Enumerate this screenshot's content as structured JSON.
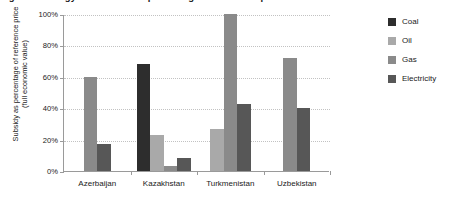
{
  "figure": {
    "title": "Figure 3. Energy subsidies as a percentage of reference price"
  },
  "axes": {
    "ylabel_line1": "Subsidy as percentage of reference price",
    "ylabel_line2": "(full economic value)",
    "ytick_labels": [
      "0%",
      "20%",
      "40%",
      "60%",
      "80%",
      "100%"
    ]
  },
  "legend": {
    "items": [
      {
        "label": "Coal",
        "color": "#2d2d2d"
      },
      {
        "label": "Oil",
        "color": "#a9a9a9"
      },
      {
        "label": "Gas",
        "color": "#8a8a8a"
      },
      {
        "label": "Electricity",
        "color": "#575757"
      }
    ]
  },
  "chart_data": {
    "type": "bar",
    "title": "Figure 3. Energy subsidies as a percentage of reference price",
    "xlabel": "",
    "ylabel": "Subsidy as percentage of reference price (full economic value)",
    "ylim": [
      0,
      100
    ],
    "yticks": [
      0,
      20,
      40,
      60,
      80,
      100
    ],
    "ytick_labels": [
      "0%",
      "20%",
      "40%",
      "60%",
      "80%",
      "100%"
    ],
    "grid": true,
    "grid_axis": "y",
    "legend_position": "right",
    "categories": [
      "Azerbaijan",
      "Kazakhstan",
      "Turkmenistan",
      "Uzbekistan"
    ],
    "series": [
      {
        "name": "Coal",
        "color": "#2d2d2d",
        "values": [
          null,
          68,
          null,
          null
        ]
      },
      {
        "name": "Oil",
        "color": "#a9a9a9",
        "values": [
          null,
          23,
          27,
          null
        ]
      },
      {
        "name": "Gas",
        "color": "#8a8a8a",
        "values": [
          60,
          3,
          100,
          72
        ]
      },
      {
        "name": "Electricity",
        "color": "#575757",
        "values": [
          17,
          8,
          43,
          40
        ]
      }
    ]
  }
}
